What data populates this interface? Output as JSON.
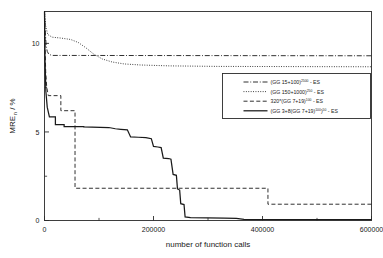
{
  "chart_data": {
    "type": "line",
    "title": "",
    "xlabel": "number of function calls",
    "ylabel": "MRE_n / %",
    "ylabel_base": "MRE",
    "ylabel_sub": "n",
    "ylabel_unit": "/ %",
    "xlim": [
      0,
      600000
    ],
    "ylim": [
      0,
      11.8
    ],
    "xticks": [
      0,
      200000,
      400000,
      600000
    ],
    "xtick_labels": [
      "0",
      "200000",
      "400000",
      "600000"
    ],
    "xticks_minor": [
      100000,
      300000,
      500000
    ],
    "yticks": [
      0,
      5,
      10
    ],
    "ytick_labels": [
      "0",
      "5",
      "10"
    ],
    "yticks_minor": [
      2.5,
      7.5
    ],
    "grid": false,
    "legend_position": "center-right",
    "series": [
      {
        "name": "(GG 15+100)^2500 - ES",
        "label_main": "(GG  15+100)",
        "label_sup": "2500",
        "label_tail": " - ES",
        "style": "dashdot",
        "color": "#1a1a1a",
        "points": [
          [
            0,
            11.8
          ],
          [
            1500,
            10.6
          ],
          [
            3000,
            9.9
          ],
          [
            5000,
            9.55
          ],
          [
            8000,
            9.38
          ],
          [
            14000,
            9.32
          ],
          [
            600000,
            9.3
          ]
        ]
      },
      {
        "name": "(GG 150+1000)^250 - ES",
        "label_main": "(GG  150+1000)",
        "label_sup": "250",
        "label_tail": " - ES",
        "style": "dotted",
        "color": "#1a1a1a",
        "points": [
          [
            0,
            11.8
          ],
          [
            2000,
            11.0
          ],
          [
            6000,
            10.5
          ],
          [
            14000,
            10.35
          ],
          [
            30000,
            10.3
          ],
          [
            48000,
            10.22
          ],
          [
            62000,
            10.05
          ],
          [
            76000,
            9.75
          ],
          [
            90000,
            9.4
          ],
          [
            106000,
            9.12
          ],
          [
            124000,
            8.95
          ],
          [
            146000,
            8.84
          ],
          [
            176000,
            8.78
          ],
          [
            230000,
            8.73
          ],
          [
            320000,
            8.7
          ],
          [
            600000,
            8.68
          ]
        ]
      },
      {
        "name": "320*(GG 7+19)^100 - ES",
        "label_main": "320*(GG  7+19)",
        "label_sup": "100",
        "label_tail": " - ES",
        "style": "dashed",
        "color": "#1a1a1a",
        "points": [
          [
            0,
            11.8
          ],
          [
            1200,
            9.6
          ],
          [
            2200,
            8.4
          ],
          [
            4000,
            7.55
          ],
          [
            7000,
            7.05
          ],
          [
            30000,
            7.05
          ],
          [
            30000,
            6.2
          ],
          [
            56000,
            6.2
          ],
          [
            56000,
            1.82
          ],
          [
            410000,
            1.82
          ],
          [
            410000,
            0.92
          ],
          [
            600000,
            0.92
          ]
        ]
      },
      {
        "name": "(GG 3+8(GG 7+19)^100)^50 - ES",
        "label_main": "(GG  3+8(GG  7+19)",
        "label_sup": "100",
        "label_sup2": "50",
        "label_tail": " - ES",
        "style": "solid",
        "color": "#1a1a1a",
        "points": [
          [
            0,
            11.8
          ],
          [
            1000,
            9.0
          ],
          [
            2500,
            7.3
          ],
          [
            5000,
            6.4
          ],
          [
            9000,
            5.85
          ],
          [
            20000,
            5.85
          ],
          [
            20000,
            5.42
          ],
          [
            36000,
            5.42
          ],
          [
            36000,
            5.3
          ],
          [
            72000,
            5.3
          ],
          [
            72000,
            5.28
          ],
          [
            118000,
            5.25
          ],
          [
            130000,
            5.18
          ],
          [
            140000,
            5.15
          ],
          [
            152000,
            5.12
          ],
          [
            158000,
            4.72
          ],
          [
            172000,
            4.7
          ],
          [
            186000,
            4.68
          ],
          [
            196000,
            4.62
          ],
          [
            200000,
            4.18
          ],
          [
            208000,
            4.15
          ],
          [
            214000,
            4.12
          ],
          [
            218000,
            3.52
          ],
          [
            228000,
            3.5
          ],
          [
            232000,
            3.46
          ],
          [
            236000,
            2.6
          ],
          [
            242000,
            2.55
          ],
          [
            244000,
            1.78
          ],
          [
            248000,
            1.72
          ],
          [
            250000,
            0.95
          ],
          [
            256000,
            0.9
          ],
          [
            258000,
            0.2
          ],
          [
            268000,
            0.16
          ],
          [
            330000,
            0.14
          ],
          [
            352000,
            0.12
          ],
          [
            366000,
            0.06
          ],
          [
            600000,
            0.05
          ]
        ]
      }
    ]
  },
  "legend": {
    "entries": [
      {
        "label_main": "(GG  15+100)",
        "sup": "2500",
        "tail": " - ES",
        "style": "dashdot"
      },
      {
        "label_main": "(GG  150+1000)",
        "sup": "250",
        "tail": " - ES",
        "style": "dotted"
      },
      {
        "label_main": "320*(GG  7+19)",
        "sup": "100",
        "tail": " - ES",
        "style": "dashed"
      },
      {
        "label_main": "(GG  3+8(GG  7+19)",
        "sup": "100",
        "sup2": "50",
        "tail": " - ES",
        "style": "solid"
      }
    ]
  }
}
